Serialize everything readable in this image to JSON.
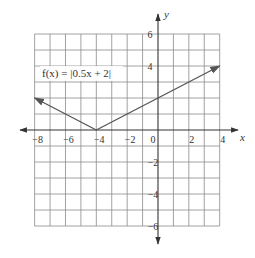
{
  "chart_data": {
    "type": "line",
    "title": "",
    "function_label": "f(x) = |0.5x + 2|",
    "xlabel": "x",
    "ylabel": "y",
    "xlim": [
      -8,
      4
    ],
    "ylim": [
      -6,
      6
    ],
    "grid": true,
    "grid_step": 1,
    "x_ticks": [
      -8,
      -6,
      -4,
      -2,
      0,
      2,
      4
    ],
    "x_tick_labels": [
      "−8",
      "−6",
      "−4",
      "−2",
      "0",
      "2",
      "4"
    ],
    "y_ticks": [
      6,
      4,
      -2,
      -4,
      -6
    ],
    "y_tick_labels": [
      "6",
      "4",
      "−2",
      "−4",
      "−6"
    ],
    "series": [
      {
        "name": "f(x) = |0.5x + 2|",
        "x": [
          -8,
          -4,
          4
        ],
        "y": [
          2,
          0,
          4
        ],
        "arrows_at_ends": true
      }
    ],
    "vertex": [
      -4,
      0
    ],
    "colors": {
      "grid": "#8a8a8a",
      "axis": "#333333",
      "curve": "#555555"
    }
  }
}
